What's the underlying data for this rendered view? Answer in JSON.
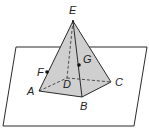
{
  "diagram": {
    "colors": {
      "face": "#cfcfcf",
      "line": "#2a2a2a",
      "plane": "#ffffff"
    },
    "plane": {
      "points": [
        [
          16,
          47
        ],
        [
          147,
          47
        ],
        [
          134,
          126
        ],
        [
          3,
          126
        ]
      ]
    },
    "vertices": {
      "A": {
        "label": "A",
        "x": 39,
        "y": 91
      },
      "B": {
        "label": "B",
        "x": 82,
        "y": 97
      },
      "C": {
        "label": "C",
        "x": 111,
        "y": 82
      },
      "D": {
        "label": "D",
        "x": 67,
        "y": 78
      },
      "E": {
        "label": "E",
        "x": 73,
        "y": 21
      }
    },
    "points": {
      "F": {
        "label": "F",
        "x": 47,
        "y": 72,
        "on": "segment AE"
      },
      "G": {
        "label": "G",
        "x": 79,
        "y": 65,
        "on": "face EBC / segment EB"
      }
    }
  }
}
